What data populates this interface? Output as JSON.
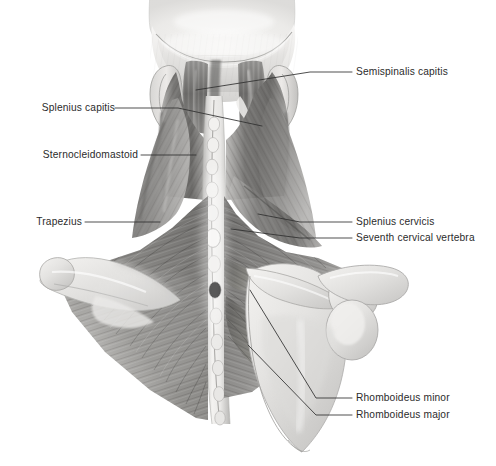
{
  "figure": {
    "panel_caption": "(a)",
    "background_color": "#ffffff",
    "text_color": "#2b2b2b",
    "leader_line_color": "#2f2f2f"
  },
  "labels": {
    "left": [
      {
        "id": "splenius-capitis",
        "text": "Splenius capitis",
        "text_x": 28,
        "text_y": 102,
        "leader": [
          [
            115,
            108
          ],
          [
            178,
            108
          ],
          [
            262,
            126
          ]
        ]
      },
      {
        "id": "sternocleidomastoid",
        "text": "Sternocleidomastoid",
        "text_x": 28,
        "text_y": 149,
        "leader": [
          [
            141,
            155
          ],
          [
            196,
            155
          ]
        ]
      },
      {
        "id": "trapezius",
        "text": "Trapezius",
        "text_x": 28,
        "text_y": 216,
        "leader": [
          [
            85,
            222
          ],
          [
            160,
            222
          ]
        ]
      }
    ],
    "right": [
      {
        "id": "semispinalis-capitis",
        "text": "Semispinalis capitis",
        "text_x": 356,
        "text_y": 66,
        "leader": [
          [
            352,
            72
          ],
          [
            310,
            72
          ],
          [
            196,
            90
          ]
        ]
      },
      {
        "id": "splenius-cervicis",
        "text": "Splenius cervicis",
        "text_x": 356,
        "text_y": 216,
        "leader": [
          [
            352,
            222
          ],
          [
            300,
            222
          ],
          [
            258,
            214
          ]
        ]
      },
      {
        "id": "seventh-cervical-vertebra",
        "text": "Seventh cervical vertebra",
        "text_x": 356,
        "text_y": 232,
        "leader": [
          [
            352,
            238
          ],
          [
            300,
            238
          ],
          [
            231,
            229
          ]
        ]
      },
      {
        "id": "rhomboideus-minor",
        "text": "Rhomboideus minor",
        "text_x": 356,
        "text_y": 392,
        "leader": [
          [
            352,
            398
          ],
          [
            316,
            398
          ],
          [
            250,
            290
          ]
        ]
      },
      {
        "id": "rhomboideus-major",
        "text": "Rhomboideus major",
        "text_x": 356,
        "text_y": 409,
        "leader": [
          [
            352,
            415
          ],
          [
            316,
            415
          ],
          [
            248,
            345
          ]
        ]
      }
    ]
  },
  "anatomy": {
    "structures": [
      "skull-occiput",
      "ear-left",
      "ear-right",
      "nuchal-ligament",
      "cervical-spinous-processes",
      "splenius-capitis-muscle",
      "semispinalis-capitis-muscle",
      "sternocleidomastoid-muscle",
      "trapezius-muscle",
      "splenius-cervicis-muscle",
      "rhomboideus-minor-muscle",
      "rhomboideus-major-muscle",
      "scapula-right",
      "scapular-spine-left",
      "acromion-right",
      "clavicle-right"
    ],
    "style": "grayscale pencil / airbrush medical illustration",
    "palette": {
      "muscle_dark": "#5d5c5a",
      "muscle_mid": "#8d8c8a",
      "muscle_light": "#b9b8b6",
      "bone_light": "#e3e2e0",
      "bone_mid": "#cfcecc",
      "skin_light": "#efeeec",
      "outline": "#6e6d6b"
    }
  }
}
